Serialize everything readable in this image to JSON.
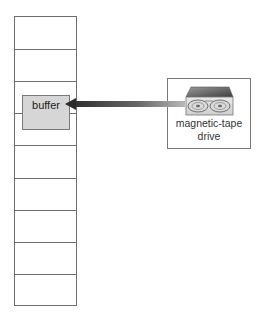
{
  "diagram": {
    "memory": {
      "cell_count": 9,
      "cell_line_offsets": [
        32,
        65,
        97,
        129,
        162,
        194,
        226,
        258
      ]
    },
    "buffer": {
      "label": "buffer",
      "fill": "#d6d6d6"
    },
    "device": {
      "label_line1": "magnetic-tape",
      "label_line2": "drive",
      "icon": "magnetic-tape-drive-icon"
    },
    "arrow": {
      "direction": "device-to-buffer",
      "gradient_start": "#3a3a3a",
      "gradient_end": "#b5b5b5"
    }
  }
}
